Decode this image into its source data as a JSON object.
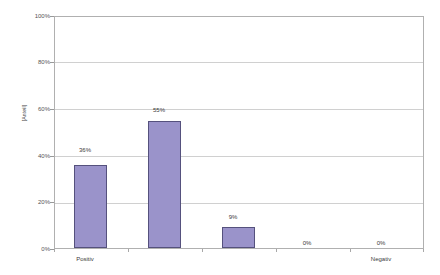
{
  "chart_data": {
    "type": "bar",
    "title": "",
    "subtitle": "",
    "xlabel": "",
    "ylabel": "[Anteil]",
    "ylim": [
      0,
      100
    ],
    "yticks": [
      "0%",
      "20%",
      "40%",
      "60%",
      "80%",
      "100%"
    ],
    "ytick_values": [
      0,
      20,
      40,
      60,
      80,
      100
    ],
    "grid": true,
    "legend": "none",
    "categories": [
      "Positiv",
      "",
      "",
      "",
      "Negativ"
    ],
    "category_labels_shown": [
      "Positiv",
      "Negativ"
    ],
    "values": [
      36,
      55,
      9,
      0,
      0
    ],
    "data_labels": [
      "36%",
      "55%",
      "9%",
      "0%",
      "0%"
    ],
    "series": [
      {
        "name": "",
        "values": [
          36,
          55,
          9,
          0,
          0
        ]
      }
    ],
    "colors": {
      "bar_fill": "#9a93ca",
      "bar_border": "#55517d",
      "gridline": "#d0d0d0",
      "axis": "#b0b0b0",
      "text": "#3a3a3a",
      "background": "#ffffff"
    }
  },
  "axis": {
    "y_title": "[Anteil]",
    "y_tick_0": "0%",
    "y_tick_1": "20%",
    "y_tick_2": "40%",
    "y_tick_3": "60%",
    "y_tick_4": "80%",
    "y_tick_5": "100%",
    "x_label_first": "Positiv",
    "x_label_last": "Negativ"
  },
  "bars": [
    {
      "label": "36%",
      "value": 36,
      "category": "Positiv"
    },
    {
      "label": "55%",
      "value": 55,
      "category": ""
    },
    {
      "label": "9%",
      "value": 9,
      "category": ""
    },
    {
      "label": "0%",
      "value": 0,
      "category": ""
    },
    {
      "label": "0%",
      "value": 0,
      "category": "Negativ"
    }
  ]
}
